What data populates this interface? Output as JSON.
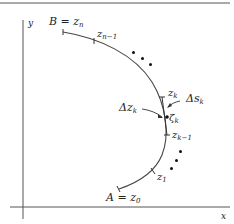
{
  "figure": {
    "type": "contour-partition-diagram",
    "axes": {
      "x_label": "x",
      "y_label": "y"
    },
    "curve": {
      "start_label": {
        "main": "A = z",
        "sub": "0"
      },
      "end_label": {
        "main": "B = z",
        "sub": "n"
      }
    },
    "points": [
      {
        "id": "z0",
        "main": "z",
        "sub": "1"
      },
      {
        "id": "zk-1",
        "main": "z",
        "sub": "k−1"
      },
      {
        "id": "zk",
        "main": "z",
        "sub": "k"
      },
      {
        "id": "zeta-k",
        "main": "ζ",
        "sub": "k"
      },
      {
        "id": "zn-1",
        "main": "z",
        "sub": "n−1"
      }
    ],
    "annotations": {
      "chord": {
        "main": "Δz",
        "sub": "k"
      },
      "arc": {
        "main": "Δs",
        "sub": "k"
      }
    },
    "colors": {
      "line": "#444444",
      "text": "#222222",
      "background": "#ffffff"
    }
  }
}
